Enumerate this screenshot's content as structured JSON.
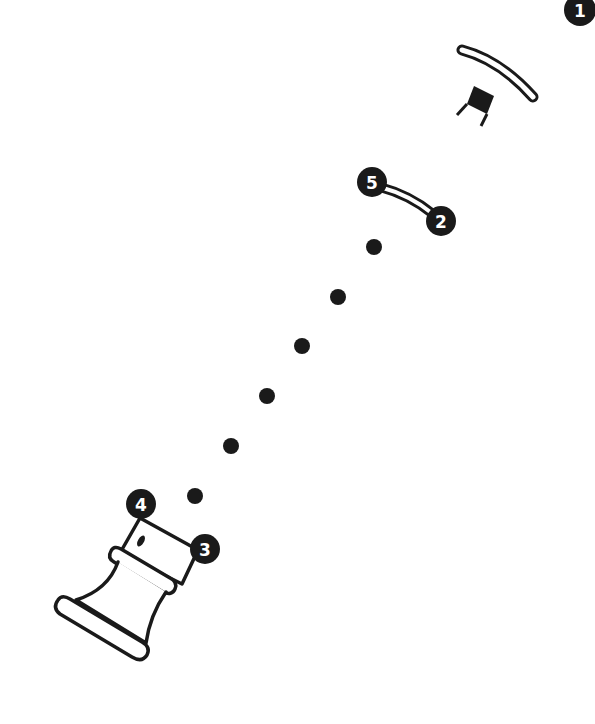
{
  "diagram": {
    "colors": {
      "ink": "#1a1a1a",
      "background": "#ffffff",
      "badge_text": "#ffffff"
    },
    "badges": [
      {
        "label": "1",
        "x": 580,
        "y": 10
      },
      {
        "label": "2",
        "x": 441,
        "y": 221
      },
      {
        "label": "3",
        "x": 205,
        "y": 549
      },
      {
        "label": "4",
        "x": 141,
        "y": 504
      },
      {
        "label": "5",
        "x": 372,
        "y": 182
      }
    ],
    "path_dots": [
      {
        "x": 374,
        "y": 247
      },
      {
        "x": 338,
        "y": 297
      },
      {
        "x": 302,
        "y": 346
      },
      {
        "x": 267,
        "y": 396
      },
      {
        "x": 231,
        "y": 446
      },
      {
        "x": 195,
        "y": 496
      }
    ]
  }
}
